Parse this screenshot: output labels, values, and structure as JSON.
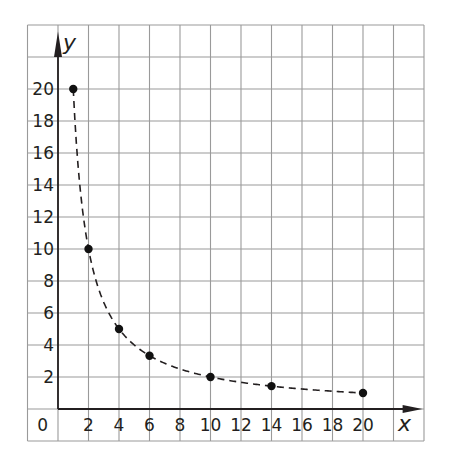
{
  "chart_data": {
    "type": "scatter",
    "title": "",
    "xlabel": "x",
    "ylabel": "y",
    "x": [
      1,
      2,
      4,
      6,
      10,
      14,
      20
    ],
    "values": [
      20,
      10,
      5,
      3.33,
      2,
      1.43,
      1
    ],
    "series": [
      {
        "name": "y = 20/x",
        "x": [
          1,
          2,
          4,
          6,
          10,
          14,
          20
        ],
        "values": [
          20,
          10,
          5,
          3.33,
          2,
          1.43,
          1
        ],
        "style": "points with dashed curve"
      }
    ],
    "xlim": [
      -2,
      24
    ],
    "ylim": [
      -2,
      24
    ],
    "x_ticks": [
      "0",
      "2",
      "4",
      "6",
      "8",
      "10",
      "12",
      "14",
      "16",
      "18",
      "20"
    ],
    "y_ticks": [
      "2",
      "4",
      "6",
      "8",
      "10",
      "12",
      "14",
      "16",
      "18",
      "20"
    ],
    "grid": true,
    "legend": null,
    "colors": {
      "grid": "#9a9a9a",
      "axis": "#231f20",
      "points": "#111111"
    }
  }
}
